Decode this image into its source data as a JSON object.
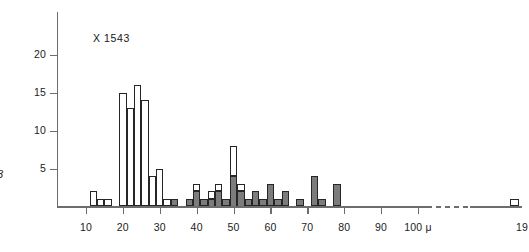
{
  "chart_data": {
    "type": "bar",
    "title": "X 1543",
    "xlabel": "100 μ",
    "ylabel": "",
    "side_label": "3",
    "xlim": [
      5,
      195
    ],
    "ylim": [
      0,
      23
    ],
    "grid": false,
    "legend": "none",
    "bin_width": 2,
    "axis_break": {
      "from": 102,
      "to": 178,
      "style": "dashed"
    },
    "y_ticks": [
      5,
      10,
      15,
      20
    ],
    "y_tick_labels": [
      "5",
      "10",
      "15",
      "20"
    ],
    "x_ticks": [
      10,
      20,
      30,
      40,
      50,
      60,
      70,
      80,
      90,
      100,
      190
    ],
    "x_tick_labels": [
      "10",
      "20",
      "30",
      "40",
      "50",
      "60",
      "70",
      "80",
      "90",
      "100 μ",
      "19"
    ],
    "series": [
      {
        "name": "open",
        "fill": "#ffffff",
        "bins": [
          11,
          13,
          15,
          19,
          21,
          23,
          25,
          27,
          29,
          31,
          39,
          43,
          45,
          49,
          51,
          193
        ],
        "values": [
          2,
          1,
          1,
          15,
          13,
          16,
          14,
          4,
          5,
          1,
          1,
          1,
          1,
          4,
          1,
          1
        ]
      },
      {
        "name": "shaded",
        "fill": "#7c7c7c",
        "bins": [
          33,
          37,
          39,
          41,
          43,
          45,
          47,
          49,
          51,
          53,
          55,
          57,
          59,
          61,
          63,
          67,
          71,
          73,
          77
        ],
        "values": [
          1,
          1,
          2,
          1,
          1,
          2,
          1,
          4,
          2,
          1,
          2,
          1,
          3,
          1,
          2,
          1,
          4,
          1,
          3
        ]
      }
    ],
    "colors": {
      "open_fill": "#ffffff",
      "shaded_fill": "#7c7c7c",
      "stroke": "#262626",
      "axis": "#6d6d6d"
    }
  }
}
